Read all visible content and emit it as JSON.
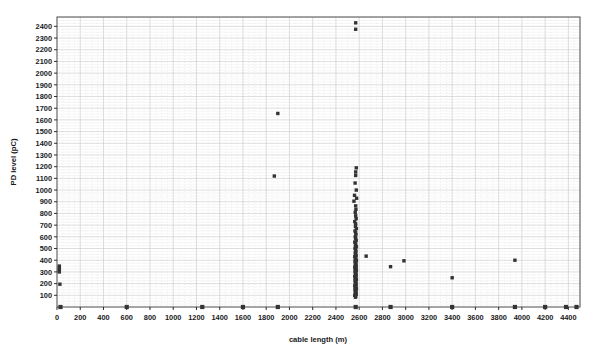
{
  "chart_data": {
    "type": "scatter",
    "title": "",
    "xlabel": "cable length (m)",
    "ylabel": "PD level (pC)",
    "xlim": [
      0,
      4500
    ],
    "ylim": [
      0,
      2480
    ],
    "grid": true,
    "legend": false,
    "marker": "square",
    "marker_color": "#333333",
    "xticks": [
      0,
      200,
      400,
      600,
      800,
      1000,
      1200,
      1400,
      1600,
      1800,
      2000,
      2200,
      2400,
      2600,
      2800,
      3000,
      3200,
      3400,
      3600,
      3800,
      4000,
      4200,
      4400
    ],
    "yticks": [
      100,
      200,
      300,
      400,
      500,
      600,
      700,
      800,
      900,
      1000,
      1100,
      1200,
      1300,
      1400,
      1500,
      1600,
      1700,
      1800,
      1900,
      2000,
      2100,
      2200,
      2300,
      2400
    ],
    "series": [
      {
        "name": "baseline markers",
        "marker_size": 4.2,
        "points": [
          [
            30,
            0
          ],
          [
            600,
            0
          ],
          [
            1250,
            0
          ],
          [
            1600,
            0
          ],
          [
            1900,
            0
          ],
          [
            2570,
            0
          ],
          [
            2870,
            0
          ],
          [
            3400,
            0
          ],
          [
            3940,
            0
          ],
          [
            4200,
            0
          ],
          [
            4380,
            0
          ],
          [
            4470,
            0
          ]
        ]
      },
      {
        "name": "PD measurements",
        "marker_size": 3.4,
        "points": [
          [
            20,
            350
          ],
          [
            20,
            330
          ],
          [
            20,
            315
          ],
          [
            20,
            300
          ],
          [
            25,
            195
          ],
          [
            1870,
            1120
          ],
          [
            1900,
            1655
          ],
          [
            2570,
            2430
          ],
          [
            2570,
            2375
          ],
          [
            2575,
            1190
          ],
          [
            2570,
            1155
          ],
          [
            2570,
            1125
          ],
          [
            2565,
            1060
          ],
          [
            2575,
            1000
          ],
          [
            2560,
            955
          ],
          [
            2578,
            930
          ],
          [
            2555,
            905
          ],
          [
            2570,
            865
          ],
          [
            2572,
            835
          ],
          [
            2566,
            810
          ],
          [
            2570,
            780
          ],
          [
            2574,
            755
          ],
          [
            2562,
            730
          ],
          [
            2570,
            710
          ],
          [
            2568,
            690
          ],
          [
            2576,
            670
          ],
          [
            2564,
            650
          ],
          [
            2570,
            635
          ],
          [
            2572,
            618
          ],
          [
            2566,
            600
          ],
          [
            2570,
            585
          ],
          [
            2574,
            570
          ],
          [
            2562,
            555
          ],
          [
            2570,
            540
          ],
          [
            2568,
            528
          ],
          [
            2576,
            515
          ],
          [
            2564,
            500
          ],
          [
            2570,
            488
          ],
          [
            2572,
            475
          ],
          [
            2566,
            462
          ],
          [
            2570,
            450
          ],
          [
            2574,
            440
          ],
          [
            2562,
            430
          ],
          [
            2570,
            420
          ],
          [
            2568,
            410
          ],
          [
            2576,
            400
          ],
          [
            2564,
            392
          ],
          [
            2570,
            383
          ],
          [
            2572,
            374
          ],
          [
            2566,
            365
          ],
          [
            2570,
            356
          ],
          [
            2574,
            348
          ],
          [
            2562,
            340
          ],
          [
            2570,
            332
          ],
          [
            2568,
            324
          ],
          [
            2576,
            316
          ],
          [
            2564,
            308
          ],
          [
            2570,
            300
          ],
          [
            2572,
            292
          ],
          [
            2566,
            284
          ],
          [
            2570,
            276
          ],
          [
            2574,
            268
          ],
          [
            2562,
            260
          ],
          [
            2570,
            252
          ],
          [
            2568,
            244
          ],
          [
            2576,
            236
          ],
          [
            2564,
            228
          ],
          [
            2570,
            220
          ],
          [
            2572,
            212
          ],
          [
            2566,
            204
          ],
          [
            2570,
            196
          ],
          [
            2574,
            188
          ],
          [
            2562,
            180
          ],
          [
            2570,
            172
          ],
          [
            2568,
            164
          ],
          [
            2576,
            156
          ],
          [
            2564,
            148
          ],
          [
            2570,
            140
          ],
          [
            2572,
            132
          ],
          [
            2566,
            124
          ],
          [
            2570,
            116
          ],
          [
            2574,
            108
          ],
          [
            2562,
            100
          ],
          [
            2570,
            92
          ],
          [
            2568,
            84
          ],
          [
            2660,
            435
          ],
          [
            2870,
            345
          ],
          [
            2985,
            395
          ],
          [
            3400,
            250
          ],
          [
            3940,
            400
          ]
        ]
      }
    ]
  }
}
